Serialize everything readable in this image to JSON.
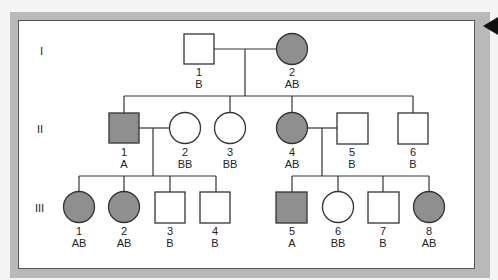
{
  "diagram": {
    "type": "pedigree",
    "colors": {
      "affected_fill": "#8f8f8f",
      "unaffected_fill": "#ffffff",
      "line": "#333333",
      "frame": "#b9b9b9"
    },
    "generations": [
      {
        "label": "I",
        "individuals": [
          {
            "id": "1",
            "genotype": "B",
            "sex": "male",
            "affected": false
          },
          {
            "id": "2",
            "genotype": "AB",
            "sex": "female",
            "affected": true
          }
        ]
      },
      {
        "label": "II",
        "individuals": [
          {
            "id": "1",
            "genotype": "A",
            "sex": "male",
            "affected": true
          },
          {
            "id": "2",
            "genotype": "BB",
            "sex": "female",
            "affected": false
          },
          {
            "id": "3",
            "genotype": "BB",
            "sex": "female",
            "affected": false
          },
          {
            "id": "4",
            "genotype": "AB",
            "sex": "female",
            "affected": true
          },
          {
            "id": "5",
            "genotype": "B",
            "sex": "male",
            "affected": false
          },
          {
            "id": "6",
            "genotype": "B",
            "sex": "male",
            "affected": false
          }
        ]
      },
      {
        "label": "III",
        "individuals": [
          {
            "id": "1",
            "genotype": "AB",
            "sex": "female",
            "affected": true
          },
          {
            "id": "2",
            "genotype": "AB",
            "sex": "female",
            "affected": true
          },
          {
            "id": "3",
            "genotype": "B",
            "sex": "male",
            "affected": false
          },
          {
            "id": "4",
            "genotype": "B",
            "sex": "male",
            "affected": false
          },
          {
            "id": "5",
            "genotype": "A",
            "sex": "male",
            "affected": true
          },
          {
            "id": "6",
            "genotype": "BB",
            "sex": "female",
            "affected": false
          },
          {
            "id": "7",
            "genotype": "B",
            "sex": "male",
            "affected": false
          },
          {
            "id": "8",
            "genotype": "AB",
            "sex": "female",
            "affected": true
          }
        ]
      }
    ]
  }
}
